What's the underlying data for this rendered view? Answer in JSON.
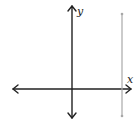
{
  "diagram": {
    "type": "coordinate-plane",
    "axes": {
      "x_label": "x",
      "y_label": "y",
      "color": "#222222"
    },
    "vertical_line": {
      "description": "vertical line to the right of the y-axis",
      "color": "#a8a8a8"
    }
  }
}
